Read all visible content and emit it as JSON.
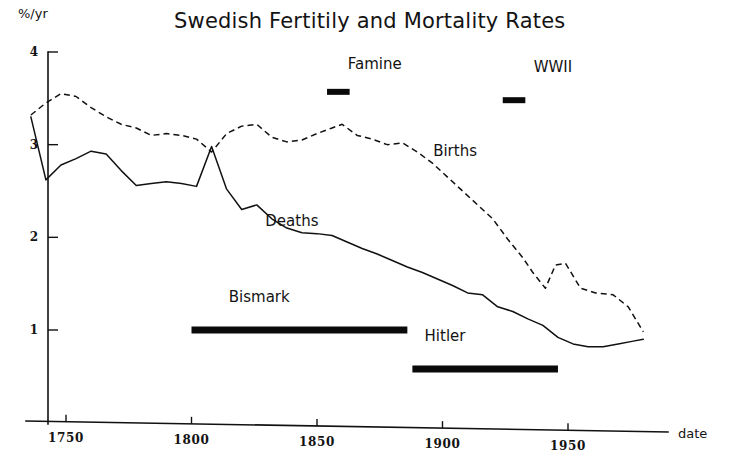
{
  "chart_data": {
    "type": "line",
    "title": "Swedish Fertitily and Mortality Rates",
    "xlabel": "date",
    "ylabel": "%/yr",
    "xlim": [
      1735,
      1985
    ],
    "ylim": [
      0,
      4
    ],
    "grid": false,
    "legend": "inline-labels",
    "xticks": [
      1750,
      1800,
      1850,
      1900,
      1950
    ],
    "xtick_labels": [
      "1750",
      "1800",
      "1850",
      "1900",
      "1950"
    ],
    "yticks": [
      1,
      2,
      3,
      4
    ],
    "ytick_labels": [
      "1",
      "2",
      "3",
      "4"
    ],
    "series": [
      {
        "name": "Births",
        "style": "dashed",
        "label_x": 1905,
        "label_y": 2.88,
        "x": [
          1736,
          1742,
          1748,
          1754,
          1760,
          1766,
          1772,
          1778,
          1784,
          1790,
          1796,
          1802,
          1808,
          1814,
          1820,
          1826,
          1832,
          1838,
          1844,
          1850,
          1856,
          1860,
          1866,
          1872,
          1878,
          1884,
          1890,
          1896,
          1902,
          1908,
          1914,
          1920,
          1926,
          1932,
          1936,
          1941,
          1945,
          1949,
          1955,
          1961,
          1968,
          1974,
          1980
        ],
        "y": [
          3.32,
          3.45,
          3.55,
          3.52,
          3.4,
          3.3,
          3.22,
          3.18,
          3.1,
          3.12,
          3.1,
          3.06,
          2.92,
          3.12,
          3.2,
          3.22,
          3.08,
          3.03,
          3.05,
          3.12,
          3.18,
          3.22,
          3.1,
          3.06,
          3.0,
          3.02,
          2.92,
          2.8,
          2.65,
          2.5,
          2.35,
          2.2,
          1.98,
          1.78,
          1.62,
          1.45,
          1.7,
          1.72,
          1.45,
          1.4,
          1.38,
          1.25,
          0.98
        ]
      },
      {
        "name": "Deaths",
        "style": "solid",
        "label_x": 1840,
        "label_y": 2.12,
        "x": [
          1736,
          1742,
          1748,
          1754,
          1760,
          1766,
          1772,
          1778,
          1784,
          1790,
          1796,
          1802,
          1808,
          1814,
          1820,
          1826,
          1832,
          1838,
          1844,
          1850,
          1856,
          1862,
          1868,
          1874,
          1880,
          1886,
          1892,
          1898,
          1904,
          1910,
          1916,
          1922,
          1928,
          1934,
          1940,
          1946,
          1952,
          1958,
          1964,
          1970,
          1976,
          1980
        ],
        "y": [
          3.3,
          2.62,
          2.78,
          2.85,
          2.93,
          2.9,
          2.72,
          2.56,
          2.58,
          2.6,
          2.58,
          2.55,
          2.98,
          2.52,
          2.3,
          2.35,
          2.2,
          2.1,
          2.05,
          2.04,
          2.02,
          1.95,
          1.88,
          1.82,
          1.75,
          1.68,
          1.62,
          1.55,
          1.48,
          1.4,
          1.38,
          1.25,
          1.2,
          1.12,
          1.05,
          0.92,
          0.85,
          0.82,
          0.82,
          0.85,
          0.88,
          0.9
        ]
      }
    ],
    "annotations": [
      {
        "name": "famine",
        "label": "Famine",
        "label_x": 1873,
        "label_y": 3.82,
        "bar_x_start": 1854,
        "bar_x_end": 1863,
        "bar_y": 3.57,
        "weight": "small"
      },
      {
        "name": "wwii",
        "label": "WWII",
        "label_x": 1944,
        "label_y": 3.78,
        "bar_x_start": 1924,
        "bar_x_end": 1933,
        "bar_y": 3.48,
        "weight": "small"
      },
      {
        "name": "bismark",
        "label": "Bismark",
        "label_x": 1827,
        "label_y": 1.3,
        "bar_x_start": 1800,
        "bar_x_end": 1886,
        "bar_y": 1.0,
        "weight": "thick"
      },
      {
        "name": "hitler",
        "label": "Hitler",
        "label_x": 1901,
        "label_y": 0.88,
        "bar_x_start": 1888,
        "bar_x_end": 1946,
        "bar_y": 0.58,
        "weight": "thick"
      }
    ]
  }
}
